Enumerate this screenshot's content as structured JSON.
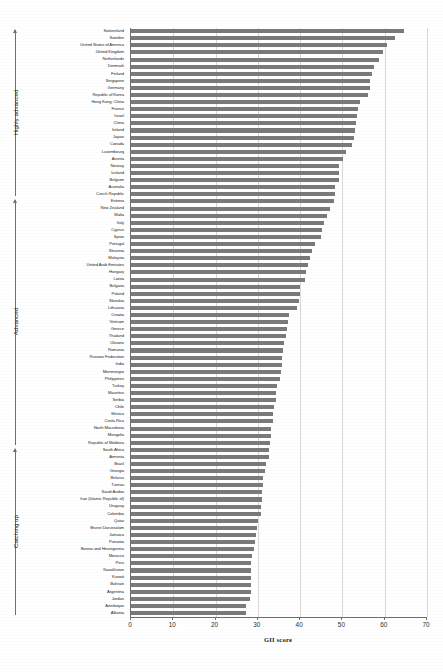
{
  "chart_data": {
    "type": "bar",
    "orientation": "horizontal",
    "title": "",
    "xlabel": "GII score",
    "ylabel": "",
    "xlim": [
      0,
      70
    ],
    "xticks": [
      0,
      10,
      20,
      30,
      40,
      50,
      60,
      70
    ],
    "grid": true,
    "legend": null,
    "bar_color": "#7a7a7a",
    "categories": [
      "Switzerland",
      "Sweden",
      "United States of America",
      "United Kingdom",
      "Netherlands",
      "Denmark",
      "Finland",
      "Singapore",
      "Germany",
      "Republic of Korea",
      "Hong Kong, China",
      "France",
      "Israel",
      "China",
      "Ireland",
      "Japan",
      "Canada",
      "Luxembourg",
      "Austria",
      "Norway",
      "Iceland",
      "Belgium",
      "Australia",
      "Czech Republic",
      "Estonia",
      "New Zealand",
      "Malta",
      "Italy",
      "Cyprus",
      "Spain",
      "Portugal",
      "Slovenia",
      "Malaysia",
      "United Arab Emirates",
      "Hungary",
      "Latvia",
      "Bulgaria",
      "Poland",
      "Slovakia",
      "Lithuania",
      "Croatia",
      "Vietnam",
      "Greece",
      "Thailand",
      "Ukraine",
      "Romania",
      "Russian Federation",
      "India",
      "Montenegro",
      "Philippines",
      "Turkey",
      "Mauritius",
      "Serbia",
      "Chile",
      "Mexico",
      "Costa Rica",
      "North Macedonia",
      "Mongolia",
      "Republic of Moldova",
      "South Africa",
      "Armenia",
      "Brazil",
      "Georgia",
      "Belarus",
      "Tunisia",
      "Saudi Arabia",
      "Iran (Islamic Republic of)",
      "Uruguay",
      "Colombia",
      "Qatar",
      "Brunei Darussalam",
      "Jamaica",
      "Panama",
      "Bosnia and Herzegovina",
      "Morocco",
      "Peru",
      "Kazakhstan",
      "Kuwait",
      "Bahrain",
      "Argentina",
      "Jordan",
      "Azerbaijan",
      "Albania"
    ],
    "values": [
      64.5,
      62.4,
      60.6,
      59.7,
      58.7,
      57.5,
      57.0,
      56.6,
      56.5,
      56.1,
      54.2,
      53.7,
      53.4,
      53.3,
      53.0,
      52.7,
      52.3,
      50.8,
      50.1,
      49.3,
      49.2,
      49.1,
      48.3,
      48.2,
      48.0,
      47.0,
      46.4,
      45.7,
      45.2,
      45.0,
      43.5,
      42.9,
      42.4,
      41.8,
      41.5,
      41.1,
      40.0,
      40.0,
      39.7,
      39.2,
      37.3,
      37.1,
      36.8,
      36.6,
      36.3,
      35.9,
      35.6,
      35.6,
      35.4,
      35.2,
      34.5,
      34.4,
      34.3,
      33.9,
      33.6,
      33.5,
      33.0,
      33.0,
      32.9,
      32.7,
      32.6,
      31.9,
      31.8,
      31.3,
      31.2,
      30.9,
      30.9,
      30.8,
      30.8,
      30.0,
      29.8,
      29.6,
      29.4,
      29.0,
      28.7,
      28.4,
      28.4,
      28.4,
      28.4,
      28.3,
      28.1,
      27.2,
      27.1
    ],
    "tier_groups": [
      {
        "name": "Highly advanced",
        "start_index": 0,
        "end_index": 23
      },
      {
        "name": "Advanced",
        "start_index": 24,
        "end_index": 58
      },
      {
        "name": "Catching up",
        "start_index": 59,
        "end_index": 82
      }
    ]
  }
}
